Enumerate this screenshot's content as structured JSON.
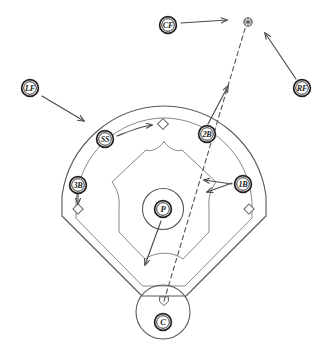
{
  "diagram": {
    "type": "baseball-field-positioning",
    "background_color": "#ffffff",
    "line_color": "#57585a",
    "label_color": "#231f20"
  },
  "positions": [
    {
      "id": "lf",
      "abbr": "LF",
      "name": "Left Fielder",
      "x": 30,
      "y": 88,
      "movement": "down-right",
      "arrow": {
        "x1": 42,
        "y1": 96,
        "x2": 84,
        "y2": 121
      }
    },
    {
      "id": "cf",
      "abbr": "CF",
      "name": "Center Fielder",
      "x": 168,
      "y": 25,
      "movement": "right",
      "arrow": {
        "x1": 180,
        "y1": 23,
        "x2": 228,
        "y2": 20
      }
    },
    {
      "id": "rf",
      "abbr": "RF",
      "name": "Right Fielder",
      "x": 302,
      "y": 88,
      "movement": "up-left",
      "arrow": {
        "x1": 296,
        "y1": 79,
        "x2": 264,
        "y2": 32
      }
    },
    {
      "id": "ss",
      "abbr": "SS",
      "name": "Shortstop",
      "x": 105,
      "y": 139,
      "movement": "right-to-second-base",
      "arrow": {
        "x1": 117,
        "y1": 135,
        "x2": 153,
        "y2": 125
      }
    },
    {
      "id": "2b",
      "abbr": "2B",
      "name": "Second Baseman",
      "x": 207,
      "y": 134,
      "movement": "up-right",
      "arrow": {
        "x1": 209,
        "y1": 124,
        "x2": 228,
        "y2": 85
      }
    },
    {
      "id": "1b",
      "abbr": "1B",
      "name": "First Baseman",
      "x": 243,
      "y": 184,
      "movement": "left-cutoff",
      "arrow": {
        "x1": 232,
        "y1": 184,
        "x2": 203,
        "y2": 180
      },
      "arrow2": {
        "x1": 233,
        "y1": 180,
        "x2": 202,
        "y2": 177
      }
    },
    {
      "id": "3b",
      "abbr": "3B",
      "name": "Third Baseman",
      "x": 78,
      "y": 185,
      "movement": "down-to-third-base",
      "arrow": {
        "x1": 78,
        "y1": 194,
        "x2": 78,
        "y2": 206
      }
    },
    {
      "id": "p",
      "abbr": "P",
      "name": "Pitcher",
      "x": 163,
      "y": 209,
      "movement": "down-left-backup",
      "arrow": {
        "x1": 161,
        "y1": 220,
        "x2": 144,
        "y2": 266
      }
    },
    {
      "id": "c",
      "abbr": "C",
      "name": "Catcher",
      "x": 163,
      "y": 322,
      "movement": "stationary-at-home",
      "arrow": null
    }
  ],
  "ball": {
    "label": "batted-ball-landing-spot",
    "x": 248,
    "y": 22,
    "marker": "circle-with-cross"
  },
  "trajectory": {
    "label": "ball-flight-path",
    "style": "dashed",
    "from": {
      "x": 164,
      "y": 301
    },
    "to": {
      "x": 245,
      "y": 28
    }
  },
  "field_features": {
    "home_plate": {
      "x": 164,
      "y": 301
    },
    "first_base": {
      "x": 249,
      "y": 209
    },
    "second_base": {
      "x": 163,
      "y": 124
    },
    "third_base": {
      "x": 78,
      "y": 209
    },
    "pitchers_mound": {
      "x": 163,
      "y": 209
    },
    "catcher_circle": {
      "x": 163,
      "y": 312
    },
    "outfield_wall": "arc",
    "infield_dirt": "arc",
    "grass_diamond": "polygon"
  }
}
